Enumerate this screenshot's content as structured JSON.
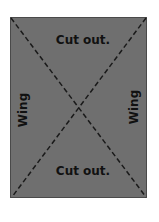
{
  "diagram": {
    "colors": {
      "sheet": "#6f6f6f",
      "border": "#4a4a4a",
      "lines": "#1a1a1a",
      "text": "#111111"
    },
    "labels": {
      "top": "Cut out.",
      "bottom": "Cut out.",
      "left": "Wing",
      "right": "Wing"
    }
  }
}
